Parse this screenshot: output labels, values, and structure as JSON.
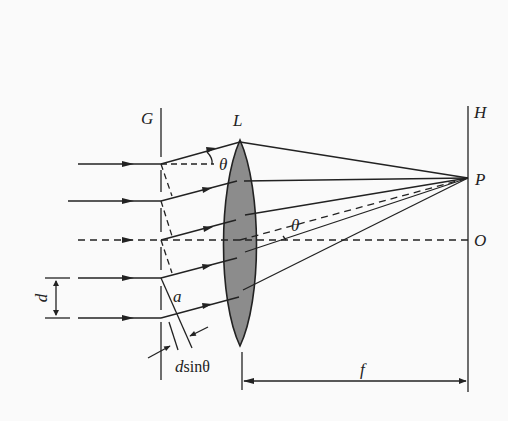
{
  "diagram": {
    "labels": {
      "grating": "G",
      "lens": "L",
      "screen": "H",
      "point_p": "P",
      "point_o": "O",
      "angle_top": "θ",
      "angle_axis": "θ",
      "spacing": "d",
      "slit_width": "a",
      "path_diff_d": "d",
      "path_diff_rest": "sinθ",
      "focal": "f"
    },
    "colors": {
      "line": "#222222",
      "lens_fill": "#8c8c8c",
      "background": "#fafafa"
    },
    "elements": {
      "incident_rays": 5,
      "diffracted_rays": 5,
      "central_ray_dashed": true
    }
  }
}
